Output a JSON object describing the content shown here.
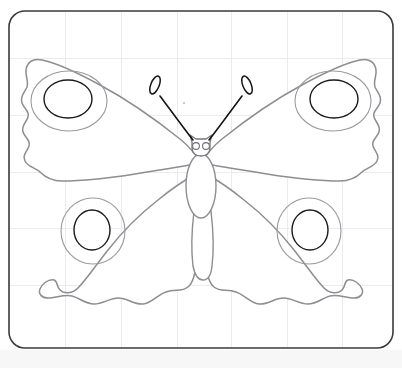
{
  "scene": {
    "title": "Butterfly coloring-page line drawing",
    "subject": "peacock-butterfly-outline",
    "canvas": {
      "width": 402,
      "height": 368
    },
    "background_color": "#ffffff",
    "below_sheet_color": "#f7f7f8"
  },
  "sheet": {
    "name": "rounded-rectangle-sheet",
    "x": 9,
    "y": 11,
    "width": 384,
    "height": 337,
    "corner_radius": 16,
    "border_color": "#3b3b3f",
    "border_width": 1.6,
    "fill_color": "#ffffff"
  },
  "grid": {
    "line_color": "#ebecee",
    "line_width": 1,
    "vertical_x": [
      65,
      121,
      177,
      231,
      287,
      342
    ],
    "horizontal_y": [
      58,
      115,
      172,
      228,
      285
    ]
  },
  "butterfly": {
    "name": "butterfly",
    "outline_color": "#8d8d92",
    "eyespot_outline_color": "#1b1b1d",
    "eyespot_ring_color": "#9a9aa0",
    "antenna_color": "#151517",
    "symmetry_axis_x": 201,
    "wings": [
      {
        "name": "upper-left-wing",
        "path": "M 201 163 C 196 155 190 147 180 139 C 160 123 128 100 100 85 C 78 73 57 63 42 60 C 33 58 27 62 26 70 C 25 76 29 81 27 87 C 24 93 20 97 22 103 C 24 109 30 111 28 117 C 26 123 21 126 23 132 C 25 138 31 140 29 146 C 27 152 22 155 25 161 C 28 167 36 168 40 172 C 46 178 52 181 62 181 C 80 181 110 178 135 174 C 160 170 185 166 201 163 Z",
        "eyespot": {
          "cx": 68,
          "cy": 99,
          "rx": 24,
          "ry": 19
        },
        "ring": {
          "cx": 69,
          "cy": 101,
          "rx": 38,
          "ry": 30
        }
      },
      {
        "name": "upper-right-wing",
        "path": "M 201 163 C 206 155 212 147 222 139 C 242 123 274 100 302 85 C 324 73 345 63 360 60 C 369 58 375 62 376 70 C 377 76 373 81 375 87 C 378 93 382 97 380 103 C 378 109 372 111 374 117 C 376 123 381 126 379 132 C 377 138 371 140 373 146 C 375 152 380 155 377 161 C 374 167 366 168 362 172 C 356 178 350 181 340 181 C 322 181 292 178 267 174 C 242 170 217 166 201 163 Z",
        "eyespot": {
          "cx": 334,
          "cy": 99,
          "rx": 24,
          "ry": 19
        },
        "ring": {
          "cx": 333,
          "cy": 101,
          "rx": 38,
          "ry": 30
        }
      },
      {
        "name": "lower-left-wing",
        "path": "M 197 173 C 185 180 170 190 158 200 C 140 214 122 232 108 250 C 96 265 86 280 78 288 C 72 294 64 294 60 290 C 56 286 58 281 54 280 C 48 279 42 284 40 289 C 38 294 42 298 48 298 C 56 298 64 294 72 296 C 80 298 85 304 94 304 C 103 304 110 298 118 298 C 128 298 134 305 143 304 C 152 303 157 295 166 292 C 175 289 182 292 188 287 C 194 282 195 272 197 260 C 199 240 199 200 197 173 Z",
        "eyespot": {
          "cx": 92,
          "cy": 230,
          "rx": 18,
          "ry": 20
        },
        "ring": {
          "cx": 93,
          "cy": 231,
          "rx": 32,
          "ry": 33
        }
      },
      {
        "name": "lower-right-wing",
        "path": "M 205 173 C 217 180 232 190 244 200 C 262 214 280 232 294 250 C 306 265 316 280 324 288 C 330 294 338 294 342 290 C 346 286 344 281 348 280 C 354 279 360 284 362 289 C 364 294 360 298 354 298 C 346 298 338 294 330 296 C 322 298 317 304 308 304 C 299 304 292 298 284 298 C 274 298 268 305 259 304 C 250 303 245 295 236 292 C 227 289 220 292 214 287 C 208 282 207 272 205 260 C 203 240 203 200 205 173 Z",
        "eyespot": {
          "cx": 310,
          "cy": 230,
          "rx": 18,
          "ry": 20
        },
        "ring": {
          "cx": 309,
          "cy": 231,
          "rx": 32,
          "ry": 33
        }
      }
    ],
    "body": {
      "thorax": {
        "name": "thorax",
        "cx": 201,
        "cy": 186,
        "rx": 15,
        "ry": 32
      },
      "abdomen": {
        "name": "abdomen",
        "path": "M 194 211 C 192 228 191 250 193 266 C 195 276 199 280 203 280 C 207 280 211 276 212 266 C 214 250 213 228 211 211 Z"
      },
      "head": {
        "name": "head",
        "path": "M 192 148 L 192 142 L 190 135 L 196 139 L 206 139 L 212 135 L 210 142 L 210 148 C 210 153 206 156 201 156 C 196 156 192 153 192 148 Z"
      },
      "eyes": [
        {
          "name": "left-eye",
          "cx": 196,
          "cy": 146,
          "r": 3.4
        },
        {
          "name": "right-eye",
          "cx": 206,
          "cy": 146,
          "r": 3.4
        }
      ]
    },
    "antennae": [
      {
        "name": "left-antenna",
        "stem_path": "M 193 140 C 185 130 172 112 160 96",
        "club": {
          "cx": 155,
          "cy": 85,
          "rx": 4.2,
          "ry": 9.5,
          "rotate": 22
        }
      },
      {
        "name": "right-antenna",
        "stem_path": "M 209 140 C 217 130 230 112 242 96",
        "club": {
          "cx": 247,
          "cy": 85,
          "rx": 4.2,
          "ry": 9.5,
          "rotate": -22
        }
      }
    ],
    "speck": {
      "name": "pencil-speck",
      "cx": 184,
      "cy": 103,
      "r": 1.2
    }
  }
}
